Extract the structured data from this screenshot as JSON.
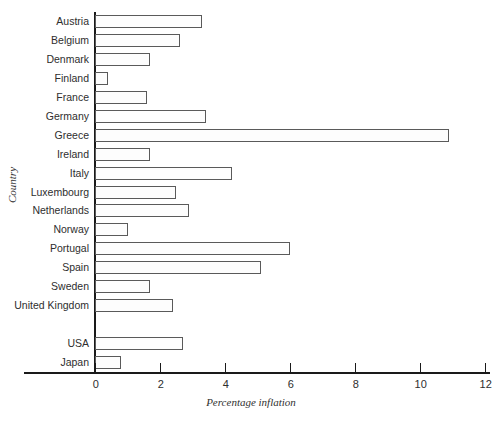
{
  "chart_data": {
    "type": "bar",
    "orientation": "horizontal",
    "title": "",
    "xlabel": "Percentage inflation",
    "ylabel": "Country",
    "xlim": [
      0,
      12
    ],
    "xticks": [
      0,
      2,
      4,
      6,
      8,
      10,
      12
    ],
    "xtick_labels": [
      "0",
      "2",
      "4",
      "6",
      "8",
      "10",
      "12"
    ],
    "grid": false,
    "legend": null,
    "gap_after": "United Kingdom",
    "categories": [
      "Austria",
      "Belgium",
      "Denmark",
      "Finland",
      "France",
      "Germany",
      "Greece",
      "Ireland",
      "Italy",
      "Luxembourg",
      "Netherlands",
      "Norway",
      "Portugal",
      "Spain",
      "Sweden",
      "United Kingdom",
      "",
      "USA",
      "Japan"
    ],
    "values": [
      3.3,
      2.6,
      1.7,
      0.4,
      1.6,
      3.4,
      10.9,
      1.7,
      4.2,
      2.5,
      2.9,
      1.0,
      6.0,
      5.1,
      1.7,
      2.4,
      null,
      2.7,
      0.8
    ]
  },
  "style": {
    "bar_edge_color": "#5a5a5a",
    "bar_fill_color": "#fdfdfd",
    "axis_color": "#1a1a1a",
    "text_color": "#2e2e2e",
    "background": "#ffffff"
  }
}
